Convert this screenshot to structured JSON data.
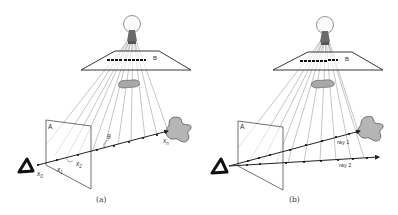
{
  "figure": {
    "panels": [
      {
        "id": "a",
        "caption": "(a)",
        "plane_a_label": "A",
        "plane_b_label": "B",
        "angle_label": "θ",
        "point_labels": {
          "x0": "x",
          "x0_sub": "0",
          "x1": "x",
          "x1_sub": "1",
          "x2": "x",
          "x2_sub": "2",
          "xn": "x",
          "xn_sub": "n"
        }
      },
      {
        "id": "b",
        "caption": "(b)",
        "plane_a_label": "A",
        "plane_b_label": "B",
        "ray1_label": "ray 1",
        "ray2_label": "ray 2"
      }
    ],
    "colors": {
      "line": "#333333",
      "light_ray": "#777777",
      "occluder_fill": "#a9a9a9",
      "object_fill": "#b5b5b5",
      "eye": "#111111"
    }
  }
}
